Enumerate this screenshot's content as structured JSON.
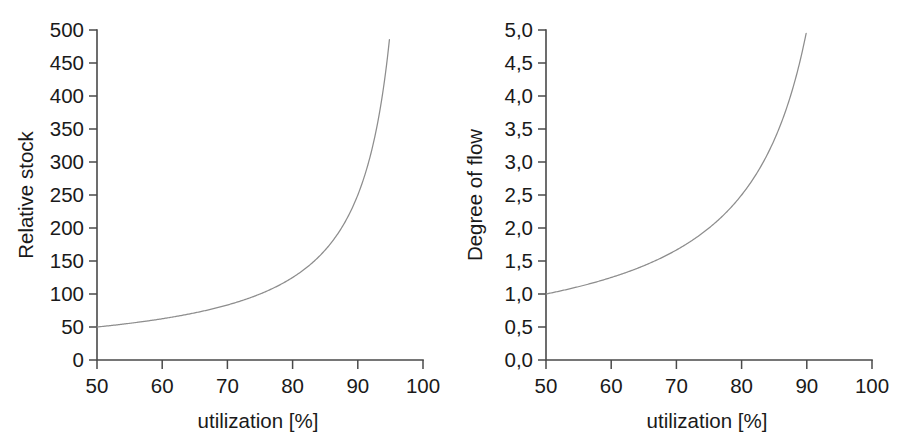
{
  "figure": {
    "background_color": "#ffffff",
    "axis_color": "#4a4a4a",
    "curve_color": "#8d8d8d",
    "text_color": "#1a1a1a"
  },
  "chart_data": [
    {
      "type": "line",
      "panel": "left",
      "title": "",
      "xlabel": "utilization [%]",
      "ylabel": "Relative stock",
      "xlim": [
        50,
        100
      ],
      "ylim": [
        0,
        500
      ],
      "xticks": [
        50,
        60,
        70,
        80,
        90,
        100
      ],
      "xticklabels": [
        "50",
        "60",
        "70",
        "80",
        "90",
        "100"
      ],
      "yticks": [
        0,
        50,
        100,
        150,
        200,
        250,
        300,
        350,
        400,
        450,
        500
      ],
      "yticklabels": [
        "0",
        "50",
        "100",
        "150",
        "200",
        "250",
        "300",
        "350",
        "400",
        "450",
        "500"
      ],
      "grid": false,
      "legend": false,
      "series": [
        {
          "name": "Relative stock",
          "x": [
            50,
            52,
            54,
            56,
            58,
            60,
            62,
            64,
            66,
            68,
            70,
            72,
            74,
            76,
            78,
            80,
            82,
            84,
            86,
            88,
            90,
            91,
            92,
            93,
            94,
            95,
            96,
            97,
            98,
            98.5,
            99
          ],
          "values": [
            50,
            52.1,
            54.3,
            56.8,
            59.5,
            62.5,
            65.8,
            69.4,
            73.5,
            78.1,
            83.3,
            89.3,
            96.2,
            104.2,
            113.6,
            125,
            138.9,
            156.3,
            178.6,
            208.3,
            250,
            277.8,
            312.5,
            357.1,
            416.7,
            500,
            625,
            833.3,
            1250,
            1667,
            2500
          ]
        }
      ]
    },
    {
      "type": "line",
      "panel": "right",
      "title": "",
      "xlabel": "utilization [%]",
      "ylabel": "Degree of flow",
      "xlim": [
        50,
        100
      ],
      "ylim": [
        0.0,
        5.0
      ],
      "xticks": [
        50,
        60,
        70,
        80,
        90,
        100
      ],
      "xticklabels": [
        "50",
        "60",
        "70",
        "80",
        "90",
        "100"
      ],
      "yticks": [
        0.0,
        0.5,
        1.0,
        1.5,
        2.0,
        2.5,
        3.0,
        3.5,
        4.0,
        4.5,
        5.0
      ],
      "yticklabels": [
        "0,0",
        "0,5",
        "1,0",
        "1,5",
        "2,0",
        "2,5",
        "3,0",
        "3,5",
        "4,0",
        "4,5",
        "5,0"
      ],
      "grid": false,
      "legend": false,
      "series": [
        {
          "name": "Degree of flow",
          "x": [
            50,
            52,
            54,
            56,
            58,
            60,
            62,
            64,
            66,
            68,
            70,
            72,
            74,
            76,
            78,
            80,
            82,
            84,
            86,
            88,
            90,
            91,
            92,
            93,
            94,
            95,
            96,
            97,
            98,
            98.5,
            99
          ],
          "values": [
            1.0,
            1.042,
            1.087,
            1.136,
            1.19,
            1.25,
            1.316,
            1.389,
            1.471,
            1.563,
            1.667,
            1.786,
            1.923,
            2.083,
            2.273,
            2.5,
            2.778,
            3.125,
            3.571,
            4.167,
            5.0,
            5.556,
            6.25,
            7.143,
            8.333,
            10.0,
            12.5,
            16.667,
            25.0,
            33.33,
            50.0
          ]
        }
      ]
    }
  ]
}
